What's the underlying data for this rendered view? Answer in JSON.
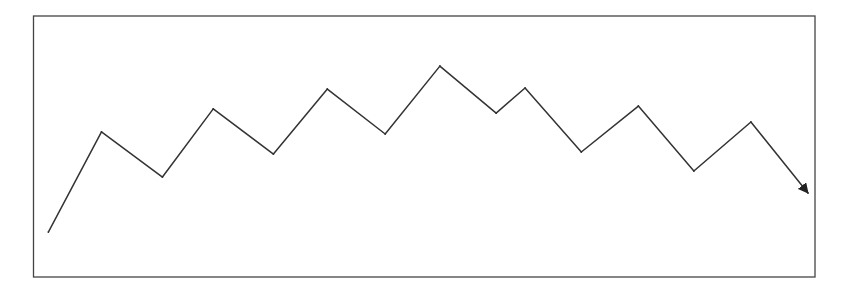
{
  "chart_data": {
    "type": "line",
    "title": "",
    "xlabel": "",
    "ylabel": "",
    "xlim": [
      0,
      100
    ],
    "ylim": [
      0,
      100
    ],
    "grid": false,
    "legend": "none",
    "end_marker": "arrow",
    "line_color": "#333333",
    "frame_color": "#444444",
    "series": [
      {
        "name": "trend",
        "x": [
          1.9,
          8.7,
          16.5,
          23.0,
          30.7,
          37.6,
          45.0,
          52.0,
          59.2,
          62.9,
          70.1,
          77.4,
          84.5,
          91.8,
          99.1
        ],
        "y": [
          17.2,
          55.6,
          38.3,
          64.4,
          47.1,
          72.0,
          54.8,
          80.8,
          62.8,
          72.4,
          47.9,
          65.5,
          40.6,
          59.4,
          32.2
        ]
      }
    ]
  }
}
